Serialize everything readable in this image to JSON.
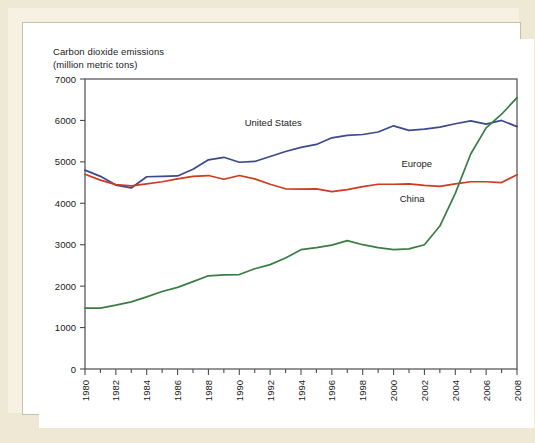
{
  "figure": {
    "axis_title_line1": "Carbon dioxide emissions",
    "axis_title_line2": "(million metric tons)",
    "caption": ""
  },
  "colors": {
    "united_states": "#3b4a8c",
    "europe": "#cf3a21",
    "china": "#3a7d44",
    "axis": "#4d4d4d",
    "frame": "#c9bfa3",
    "page_background": "#efe8d4",
    "plot_background": "#ffffff"
  },
  "chart_data": {
    "type": "line",
    "xlabel": "",
    "ylabel": "Carbon dioxide emissions (million metric tons)",
    "ylim": [
      0,
      7000
    ],
    "xlim": [
      1980,
      2008
    ],
    "grid": false,
    "legend_position": "inline-labels",
    "ytick_labels": [
      "0",
      "1000",
      "2000",
      "3000",
      "4000",
      "5000",
      "6000",
      "7000"
    ],
    "ytick_values": [
      0,
      1000,
      2000,
      3000,
      4000,
      5000,
      6000,
      7000
    ],
    "xtick_labels": [
      "1980",
      "1982",
      "1984",
      "1986",
      "1988",
      "1990",
      "1992",
      "1994",
      "1996",
      "1998",
      "2000",
      "2002",
      "2004",
      "2006",
      "2008"
    ],
    "xtick_values": [
      1980,
      1982,
      1984,
      1986,
      1988,
      1990,
      1992,
      1994,
      1996,
      1998,
      2000,
      2002,
      2004,
      2006,
      2008
    ],
    "xtick_rotation": 90,
    "x": [
      1980,
      1981,
      1982,
      1983,
      1984,
      1985,
      1986,
      1987,
      1988,
      1989,
      1990,
      1991,
      1992,
      1993,
      1994,
      1995,
      1996,
      1997,
      1998,
      1999,
      2000,
      2001,
      2002,
      2003,
      2004,
      2005,
      2006,
      2007,
      2008
    ],
    "series": [
      {
        "name": "United States",
        "color": "#3b4a8c",
        "label_x": 1992.2,
        "label_y": 5870,
        "values": [
          4800,
          4650,
          4440,
          4370,
          4640,
          4650,
          4660,
          4820,
          5050,
          5110,
          4990,
          5010,
          5130,
          5250,
          5350,
          5420,
          5580,
          5640,
          5660,
          5720,
          5870,
          5760,
          5790,
          5840,
          5920,
          5990,
          5910,
          6000,
          5850
        ]
      },
      {
        "name": "Europe",
        "color": "#cf3a21",
        "label_x": 2001.5,
        "label_y": 4870,
        "values": [
          4700,
          4560,
          4450,
          4420,
          4470,
          4520,
          4590,
          4650,
          4670,
          4580,
          4670,
          4590,
          4460,
          4350,
          4340,
          4350,
          4280,
          4330,
          4400,
          4460,
          4460,
          4470,
          4430,
          4410,
          4470,
          4520,
          4520,
          4500,
          4690
        ]
      },
      {
        "name": "China",
        "color": "#3a7d44",
        "label_x": 2001.2,
        "label_y": 4020,
        "values": [
          1470,
          1470,
          1540,
          1620,
          1740,
          1870,
          1970,
          2110,
          2250,
          2270,
          2280,
          2420,
          2520,
          2680,
          2880,
          2930,
          2990,
          3100,
          3000,
          2930,
          2880,
          2900,
          3000,
          3450,
          4240,
          5190,
          5820,
          6150,
          6550
        ]
      }
    ]
  }
}
